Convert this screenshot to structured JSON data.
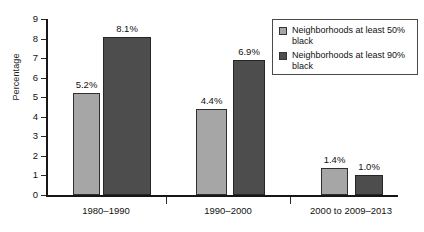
{
  "chart_data": {
    "type": "bar",
    "title": "",
    "subtitle": "",
    "xlabel": "",
    "ylabel": "Percentage",
    "ylim": [
      0,
      9
    ],
    "ytick_labels": [
      "9",
      "8",
      "7",
      "6",
      "5",
      "4",
      "3",
      "2",
      "1",
      "0"
    ],
    "grid": false,
    "legend_position": "top-right",
    "categories": [
      "1980–1990",
      "1990–2000",
      "2000 to 2009–2013"
    ],
    "series": [
      {
        "name": "Neighborhoods at least 50% black",
        "color": "#a6a6a6",
        "values": [
          5.2,
          4.4,
          1.4
        ],
        "labels": [
          "5.2%",
          "4.4%",
          "1.4%"
        ]
      },
      {
        "name": "Neighborhoods at least 90% black",
        "color": "#4d4d4d",
        "values": [
          8.1,
          6.9,
          1.0
        ],
        "labels": [
          "8.1%",
          "6.9%",
          "1.0%"
        ]
      }
    ]
  },
  "legend": {
    "entries": [
      {
        "label": "Neighborhoods at least 50% black",
        "swatch": "light-gray-swatch"
      },
      {
        "label": "Neighborhoods at least 90% black",
        "swatch": "dark-gray-swatch"
      }
    ]
  },
  "axis": {
    "y_title": "Percentage"
  }
}
